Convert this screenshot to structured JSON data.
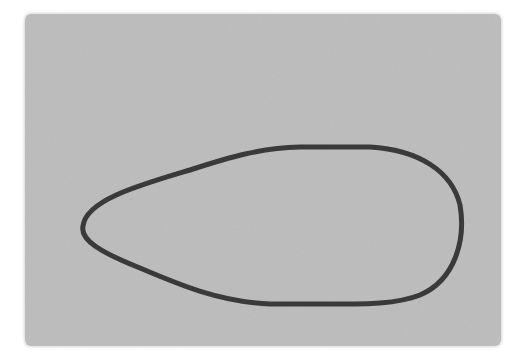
{
  "image": {
    "description": "Hand-drawn closed teardrop/loop outline on a textured gray rectangular paper swatch",
    "background_color": "#ffffff",
    "swatch_color": "#b9b9b9",
    "stroke_color": "#3a3a3a",
    "stroke_width": 5
  }
}
